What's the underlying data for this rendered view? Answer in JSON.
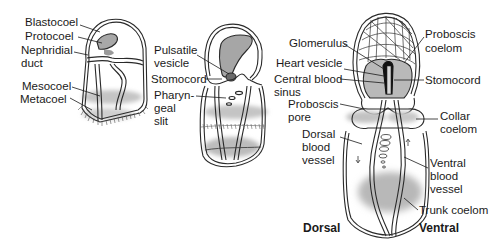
{
  "figure": {
    "type": "anatomical-diagram",
    "panels": [
      {
        "id": "panel-1",
        "labels": [
          "Blastocoel",
          "Protocoel",
          "Nephridial duct",
          "Mesocoel",
          "Metacoel"
        ]
      },
      {
        "id": "panel-2",
        "labels": [
          "Pulsatile vesicle",
          "Stomocord",
          "Pharyngeal slit"
        ]
      },
      {
        "id": "panel-3",
        "labels": [
          "Glomerulus",
          "Heart vesicle",
          "Central blood sinus",
          "Proboscis pore",
          "Dorsal blood vessel",
          "Proboscis coelom",
          "Stomocord",
          "Collar coelom",
          "Ventral blood vessel",
          "Trunk coelom"
        ]
      }
    ]
  },
  "labels": {
    "blastocoel": "Blastocoel",
    "protocoel": "Protocoel",
    "nephridial_1": "Nephridial",
    "nephridial_2": "duct",
    "mesocoel": "Mesocoel",
    "metacoel": "Metacoel",
    "pulsatile_1": "Pulsatile",
    "pulsatile_2": "vesicle",
    "stomocord_2": "Stomocord",
    "pharyn_1": "Pharyn-",
    "pharyn_2": "geal",
    "pharyn_3": "slit",
    "glomerulus": "Glomerulus",
    "heart_vesicle": "Heart vesicle",
    "central_1": "Central blood",
    "central_2": "sinus",
    "proboscis_pore_1": "Proboscis",
    "proboscis_pore_2": "pore",
    "dorsal_bv_1": "Dorsal",
    "dorsal_bv_2": "blood",
    "dorsal_bv_3": "vessel",
    "proboscis_coelom_1": "Proboscis",
    "proboscis_coelom_2": "coelom",
    "stomocord_3": "Stomocord",
    "collar_1": "Collar",
    "collar_2": "coelom",
    "ventral_bv_1": "Ventral",
    "ventral_bv_2": "blood",
    "ventral_bv_3": "vessel",
    "trunk_coelom": "Trunk coelom",
    "dorsal": "Dorsal",
    "ventral": "Ventral"
  },
  "colors": {
    "outline": "#2a2a2a",
    "shade": "#bdbdbd",
    "shade_light": "#d4d4d4",
    "dark": "#111111"
  }
}
